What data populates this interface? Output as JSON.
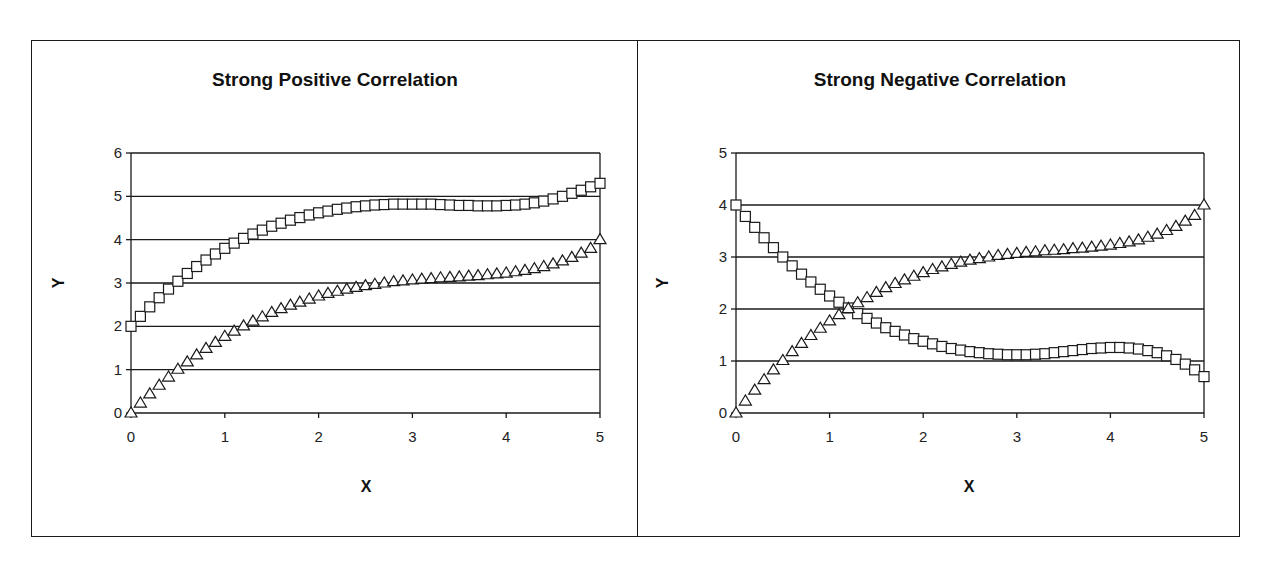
{
  "chart_data": [
    {
      "type": "scatter",
      "title": "Strong Positive Correlation",
      "xlabel": "X",
      "ylabel": "Y",
      "xlim": [
        0,
        5
      ],
      "ylim": [
        0,
        6
      ],
      "xticks": [
        "0",
        "1",
        "2",
        "3",
        "4",
        "5"
      ],
      "yticks": [
        "0",
        "1",
        "2",
        "3",
        "4",
        "5",
        "6"
      ],
      "grid": "horizontal",
      "legend": "none",
      "x": [
        0,
        0.1,
        0.2,
        0.3,
        0.4,
        0.5,
        0.6,
        0.7,
        0.8,
        0.9,
        1,
        1.1,
        1.2,
        1.3,
        1.4,
        1.5,
        1.6,
        1.7,
        1.8,
        1.9,
        2,
        2.1,
        2.2,
        2.3,
        2.4,
        2.5,
        2.6,
        2.7,
        2.8,
        2.9,
        3,
        3.1,
        3.2,
        3.3,
        3.4,
        3.5,
        3.6,
        3.7,
        3.8,
        3.9,
        4,
        4.1,
        4.2,
        4.3,
        4.4,
        4.5,
        4.6,
        4.7,
        4.8,
        4.9,
        5
      ],
      "series": [
        {
          "name": "Squares",
          "marker": "square",
          "values": [
            2.0,
            2.23,
            2.45,
            2.66,
            2.86,
            3.04,
            3.22,
            3.38,
            3.53,
            3.67,
            3.8,
            3.92,
            4.03,
            4.13,
            4.22,
            4.31,
            4.38,
            4.45,
            4.51,
            4.57,
            4.62,
            4.66,
            4.7,
            4.73,
            4.76,
            4.78,
            4.8,
            4.81,
            4.82,
            4.82,
            4.82,
            4.82,
            4.82,
            4.81,
            4.8,
            4.79,
            4.79,
            4.78,
            4.78,
            4.78,
            4.79,
            4.8,
            4.82,
            4.85,
            4.89,
            4.94,
            5.0,
            5.07,
            5.14,
            5.22,
            5.3
          ]
        },
        {
          "name": "Triangles",
          "marker": "triangle",
          "values": [
            0.0,
            0.23,
            0.44,
            0.64,
            0.83,
            1.01,
            1.18,
            1.34,
            1.49,
            1.63,
            1.77,
            1.89,
            2.01,
            2.12,
            2.22,
            2.32,
            2.41,
            2.49,
            2.56,
            2.63,
            2.7,
            2.76,
            2.81,
            2.86,
            2.9,
            2.94,
            2.97,
            3.0,
            3.03,
            3.05,
            3.07,
            3.09,
            3.1,
            3.12,
            3.13,
            3.14,
            3.16,
            3.17,
            3.19,
            3.21,
            3.23,
            3.26,
            3.29,
            3.33,
            3.38,
            3.44,
            3.51,
            3.59,
            3.69,
            3.8,
            4.0
          ]
        }
      ]
    },
    {
      "type": "scatter",
      "title": "Strong Negative Correlation",
      "xlabel": "X",
      "ylabel": "Y",
      "xlim": [
        0,
        5
      ],
      "ylim": [
        0,
        5
      ],
      "xticks": [
        "0",
        "1",
        "2",
        "3",
        "4",
        "5"
      ],
      "yticks": [
        "0",
        "1",
        "2",
        "3",
        "4",
        "5"
      ],
      "grid": "horizontal",
      "legend": "none",
      "x": [
        0,
        0.1,
        0.2,
        0.3,
        0.4,
        0.5,
        0.6,
        0.7,
        0.8,
        0.9,
        1,
        1.1,
        1.2,
        1.3,
        1.4,
        1.5,
        1.6,
        1.7,
        1.8,
        1.9,
        2,
        2.1,
        2.2,
        2.3,
        2.4,
        2.5,
        2.6,
        2.7,
        2.8,
        2.9,
        3,
        3.1,
        3.2,
        3.3,
        3.4,
        3.5,
        3.6,
        3.7,
        3.8,
        3.9,
        4,
        4.1,
        4.2,
        4.3,
        4.4,
        4.5,
        4.6,
        4.7,
        4.8,
        4.9,
        5
      ],
      "series": [
        {
          "name": "Squares",
          "marker": "square",
          "values": [
            4.0,
            3.78,
            3.57,
            3.37,
            3.18,
            3.0,
            2.83,
            2.67,
            2.52,
            2.38,
            2.25,
            2.13,
            2.02,
            1.91,
            1.82,
            1.73,
            1.64,
            1.57,
            1.5,
            1.43,
            1.38,
            1.33,
            1.28,
            1.24,
            1.21,
            1.18,
            1.16,
            1.14,
            1.13,
            1.12,
            1.12,
            1.12,
            1.13,
            1.14,
            1.16,
            1.18,
            1.2,
            1.22,
            1.24,
            1.25,
            1.26,
            1.26,
            1.25,
            1.23,
            1.2,
            1.16,
            1.1,
            1.03,
            0.94,
            0.83,
            0.7
          ]
        },
        {
          "name": "Triangles",
          "marker": "triangle",
          "values": [
            0.0,
            0.23,
            0.44,
            0.64,
            0.83,
            1.01,
            1.18,
            1.34,
            1.49,
            1.63,
            1.77,
            1.89,
            2.01,
            2.12,
            2.22,
            2.32,
            2.41,
            2.49,
            2.56,
            2.63,
            2.7,
            2.76,
            2.81,
            2.86,
            2.9,
            2.94,
            2.97,
            3.0,
            3.03,
            3.05,
            3.07,
            3.09,
            3.1,
            3.12,
            3.13,
            3.14,
            3.16,
            3.17,
            3.19,
            3.21,
            3.23,
            3.26,
            3.29,
            3.33,
            3.38,
            3.44,
            3.51,
            3.59,
            3.69,
            3.8,
            4.0
          ]
        }
      ]
    }
  ],
  "charts": {
    "left": {
      "title": "Strong Positive Correlation",
      "xlabel": "X",
      "ylabel": "Y"
    },
    "right": {
      "title": "Strong Negative Correlation",
      "xlabel": "X",
      "ylabel": "Y"
    }
  },
  "style": {
    "line_color": "#1a1a1a",
    "marker_fill": "#ffffff",
    "background": "#ffffff"
  }
}
